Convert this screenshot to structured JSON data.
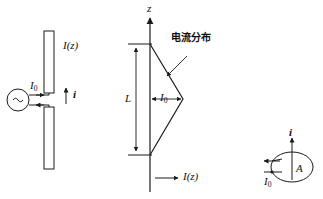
{
  "figure": {
    "stroke_color": "#1a1a1a",
    "text_color": "#111111",
    "background": "#ffffff",
    "width": 323,
    "height": 199
  },
  "panel_left": {
    "name": "short dipole antenna fed by AC source",
    "source_symbol": "~",
    "feed_current_label": "I",
    "feed_current_sub": "0",
    "rod_current_label": "I(z)",
    "element_current_label": "i",
    "upper_rod": {
      "x": 44,
      "y": 31,
      "width": 10,
      "height": 62
    },
    "lower_rod": {
      "x": 44,
      "y": 107,
      "width": 10,
      "height": 62
    },
    "source_circle": {
      "cx": 18,
      "cy": 100,
      "r": 11
    }
  },
  "panel_middle": {
    "name": "triangular current distribution along z axis",
    "axis_label": "z",
    "length_label": "L",
    "peak_current_label": "I",
    "peak_current_sub": "0",
    "current_function_label": "I(z)",
    "annotation_label": "电流分布",
    "annotation_meaning": "current distribution",
    "axis_x": 150,
    "axis_top_y": 18,
    "axis_bottom_y": 192,
    "triangle_top_y": 44,
    "triangle_bottom_y": 155,
    "triangle_apex_x": 183,
    "triangle_apex_y": 99
  },
  "panel_right": {
    "name": "small current loop with area A",
    "loop_area_label": "A",
    "loop_current_label": "i",
    "feed_current_label": "I",
    "feed_current_sub": "0",
    "loop_cx": 292,
    "loop_cy": 167,
    "loop_rx": 21,
    "loop_ry": 15
  }
}
